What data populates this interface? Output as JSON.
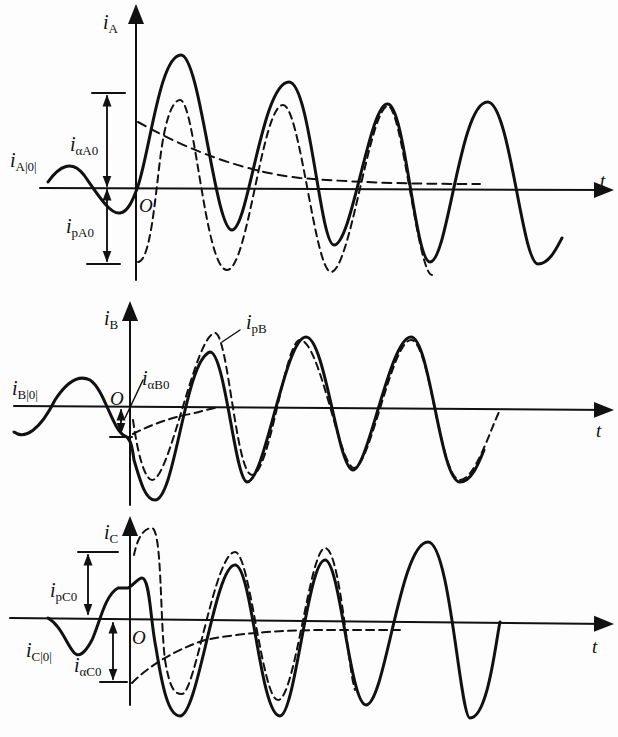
{
  "figure": {
    "panels": [
      {
        "id": "A",
        "axis_y_label": {
          "main": "i",
          "sub": "A"
        },
        "axis_x_label": "t",
        "origin_label": "O",
        "prefault_label": {
          "main": "i",
          "sub": "A|0|"
        },
        "dc_component_label": {
          "main": "i",
          "sub": "αA0"
        },
        "periodic_component_label": {
          "main": "i",
          "sub": "pA0"
        }
      },
      {
        "id": "B",
        "axis_y_label": {
          "main": "i",
          "sub": "B"
        },
        "axis_x_label": "t",
        "origin_label": "O",
        "prefault_label": {
          "main": "i",
          "sub": "B|0|"
        },
        "dc_component_label": {
          "main": "i",
          "sub": "αB0"
        },
        "periodic_component_label": {
          "main": "i",
          "sub": "pB"
        }
      },
      {
        "id": "C",
        "axis_y_label": {
          "main": "i",
          "sub": "C"
        },
        "axis_x_label": "t",
        "origin_label": "O",
        "prefault_label": {
          "main": "i",
          "sub": "C|0|"
        },
        "dc_component_label": {
          "main": "i",
          "sub": "αC0"
        },
        "periodic_component_label": {
          "main": "i",
          "sub": "pC0"
        }
      }
    ],
    "legend": {
      "solid": "total phase current",
      "dashed": "periodic and aperiodic (DC) components"
    },
    "colors": {
      "ink": "#111111",
      "background": "#fdfdfd"
    }
  }
}
